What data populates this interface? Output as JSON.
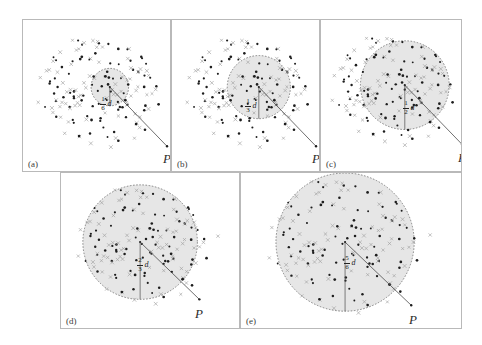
{
  "figure": {
    "caption_panels": [
      "(a)",
      "(b)",
      "(c)",
      "(d)",
      "(e)"
    ],
    "point_label": "P",
    "distance_variable": "d",
    "background_color": "#ffffff",
    "frame_color": "#b9b9b9",
    "circle_fill_color": "#e6e6e6",
    "circle_stroke_color": "#6b6b6b",
    "radius_line_color": "#4a4a4a",
    "dot_color": "#1d1d1d",
    "cross_color": "#a0a0a0"
  },
  "panels": [
    {
      "id": "a",
      "label": "(a)",
      "radius_fraction_numerator": "1",
      "radius_fraction_denominator": "6",
      "radius_variable": "d",
      "radius_text": "1/6 d",
      "p_label": "P",
      "circle": {
        "cx": 88,
        "cy": 68,
        "r": 19
      },
      "radius_line": {
        "x1": 88,
        "y1": 68,
        "x2": 146,
        "y2": 128
      },
      "p_label_pos": {
        "x": 140,
        "y": 131
      },
      "frac_pos": {
        "x": 77,
        "y": 76
      },
      "dots": [
        [
          60,
          28
        ],
        [
          77,
          23
        ],
        [
          86,
          22
        ],
        [
          92,
          19
        ],
        [
          95,
          26
        ],
        [
          100,
          24
        ],
        [
          104,
          21
        ],
        [
          112,
          27
        ],
        [
          120,
          30
        ],
        [
          48,
          36
        ],
        [
          53,
          34
        ],
        [
          57,
          39
        ],
        [
          66,
          33
        ],
        [
          71,
          37
        ],
        [
          79,
          31
        ],
        [
          84,
          35
        ],
        [
          90,
          33
        ],
        [
          97,
          36
        ],
        [
          103,
          33
        ],
        [
          110,
          36
        ],
        [
          117,
          33
        ],
        [
          124,
          38
        ],
        [
          131,
          35
        ],
        [
          38,
          45
        ],
        [
          44,
          42
        ],
        [
          51,
          47
        ],
        [
          58,
          44
        ],
        [
          64,
          48
        ],
        [
          70,
          45
        ],
        [
          76,
          49
        ],
        [
          82,
          44
        ],
        [
          89,
          47
        ],
        [
          95,
          44
        ],
        [
          101,
          48
        ],
        [
          108,
          45
        ],
        [
          114,
          49
        ],
        [
          121,
          45
        ],
        [
          127,
          49
        ],
        [
          134,
          46
        ],
        [
          34,
          54
        ],
        [
          41,
          57
        ],
        [
          47,
          53
        ],
        [
          54,
          58
        ],
        [
          61,
          55
        ],
        [
          67,
          59
        ],
        [
          73,
          54
        ],
        [
          79,
          58
        ],
        [
          85,
          55
        ],
        [
          91,
          59
        ],
        [
          97,
          55
        ],
        [
          103,
          58
        ],
        [
          110,
          55
        ],
        [
          116,
          59
        ],
        [
          123,
          55
        ],
        [
          130,
          58
        ],
        [
          136,
          55
        ],
        [
          32,
          65
        ],
        [
          39,
          68
        ],
        [
          45,
          64
        ],
        [
          52,
          69
        ],
        [
          58,
          65
        ],
        [
          65,
          68
        ],
        [
          71,
          64
        ],
        [
          77,
          69
        ],
        [
          83,
          65
        ],
        [
          89,
          68
        ],
        [
          96,
          64
        ],
        [
          102,
          69
        ],
        [
          108,
          65
        ],
        [
          115,
          68
        ],
        [
          121,
          64
        ],
        [
          128,
          69
        ],
        [
          134,
          65
        ],
        [
          36,
          78
        ],
        [
          43,
          75
        ],
        [
          49,
          79
        ],
        [
          56,
          76
        ],
        [
          62,
          80
        ],
        [
          69,
          77
        ],
        [
          75,
          81
        ],
        [
          81,
          77
        ],
        [
          88,
          80
        ],
        [
          94,
          77
        ],
        [
          100,
          81
        ],
        [
          107,
          78
        ],
        [
          113,
          82
        ],
        [
          120,
          78
        ],
        [
          126,
          82
        ],
        [
          40,
          90
        ],
        [
          47,
          87
        ],
        [
          53,
          91
        ],
        [
          60,
          88
        ],
        [
          66,
          92
        ],
        [
          73,
          89
        ],
        [
          79,
          93
        ],
        [
          86,
          89
        ],
        [
          92,
          93
        ],
        [
          99,
          90
        ],
        [
          105,
          94
        ],
        [
          112,
          90
        ],
        [
          118,
          93
        ],
        [
          44,
          101
        ],
        [
          51,
          104
        ],
        [
          58,
          100
        ],
        [
          64,
          105
        ],
        [
          71,
          101
        ],
        [
          77,
          106
        ],
        [
          84,
          102
        ],
        [
          90,
          106
        ],
        [
          97,
          102
        ],
        [
          103,
          107
        ],
        [
          110,
          103
        ],
        [
          38,
          113
        ],
        [
          45,
          116
        ],
        [
          52,
          112
        ],
        [
          59,
          117
        ],
        [
          65,
          113
        ],
        [
          72,
          118
        ],
        [
          78,
          114
        ],
        [
          85,
          118
        ],
        [
          91,
          114
        ],
        [
          98,
          119
        ],
        [
          42,
          126
        ],
        [
          49,
          129
        ],
        [
          56,
          125
        ],
        [
          62,
          130
        ],
        [
          69,
          126
        ],
        [
          75,
          131
        ],
        [
          82,
          127
        ],
        [
          88,
          131
        ],
        [
          95,
          127
        ],
        [
          129,
          121
        ],
        [
          136,
          127
        ],
        [
          143,
          124
        ]
      ]
    },
    {
      "id": "b",
      "label": "(b)",
      "radius_fraction_numerator": "1",
      "radius_fraction_denominator": "3",
      "radius_variable": "d",
      "radius_text": "1/3 d",
      "p_label": "P",
      "circle": {
        "cx": 88,
        "cy": 68,
        "r": 32
      },
      "radius_line": {
        "x1": 88,
        "y1": 68,
        "x2": 146,
        "y2": 128
      },
      "p_label_pos": {
        "x": 140,
        "y": 131
      },
      "frac_pos": {
        "x": 73,
        "y": 78
      }
    },
    {
      "id": "c",
      "label": "(c)",
      "radius_fraction_numerator": "1",
      "radius_fraction_denominator": "2",
      "radius_variable": "d",
      "radius_text": "1/2 d",
      "p_label": "P",
      "circle": {
        "cx": 85,
        "cy": 66,
        "r": 45
      },
      "radius_line": {
        "x1": 85,
        "y1": 66,
        "x2": 143,
        "y2": 126
      },
      "p_label_pos": {
        "x": 137,
        "y": 130
      },
      "frac_pos": {
        "x": 82,
        "y": 80
      }
    },
    {
      "id": "d",
      "label": "(d)",
      "radius_fraction_numerator": "2",
      "radius_fraction_denominator": "3",
      "radius_variable": "d",
      "radius_text": "2/3 d",
      "p_label": "P",
      "circle": {
        "cx": 80,
        "cy": 70,
        "r": 58
      },
      "radius_line": {
        "x1": 80,
        "y1": 70,
        "x2": 140,
        "y2": 128
      },
      "p_label_pos": {
        "x": 134,
        "y": 133
      },
      "frac_pos": {
        "x": 76,
        "y": 84
      }
    },
    {
      "id": "e",
      "label": "(e)",
      "radius_fraction_numerator": "5",
      "radius_fraction_denominator": "6",
      "radius_variable": "d",
      "radius_text": "5/6 d",
      "p_label": "P",
      "circle": {
        "cx": 105,
        "cy": 70,
        "r": 70
      },
      "radius_line": {
        "x1": 105,
        "y1": 70,
        "x2": 172,
        "y2": 134
      },
      "p_label_pos": {
        "x": 168,
        "y": 139
      },
      "frac_pos": {
        "x": 103,
        "y": 82
      }
    }
  ]
}
